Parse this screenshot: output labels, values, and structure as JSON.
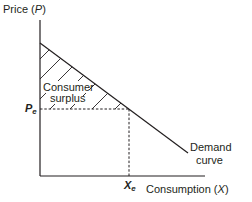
{
  "diagram": {
    "type": "economics-demand-curve",
    "y_axis": {
      "label_prefix": "Price (",
      "label_var": "P",
      "label_suffix": ")"
    },
    "x_axis": {
      "label_prefix": "Consumption (",
      "label_var": "X",
      "label_suffix": ")"
    },
    "equilibrium_price": {
      "base": "P",
      "sub": "e"
    },
    "equilibrium_quantity": {
      "base": "X",
      "sub": "e"
    },
    "region": {
      "line1": "Consumer",
      "line2": "surplus",
      "fill": "hatched"
    },
    "curve": {
      "line1": "Demand",
      "line2": "curve"
    },
    "colors": {
      "line": "#231f20",
      "background": "#ffffff"
    }
  }
}
